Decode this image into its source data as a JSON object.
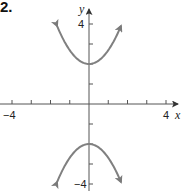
{
  "problem_number": "2.",
  "chart_data": {
    "type": "line",
    "title": "",
    "xlabel": "x",
    "ylabel": "y",
    "xlim": [
      -4.5,
      4.7
    ],
    "ylim": [
      -4.3,
      5.2
    ],
    "x_tick_labels": [
      "-4",
      "4"
    ],
    "y_tick_labels": [
      "4",
      "-4"
    ],
    "x_ticks": [
      -4,
      -3,
      -2,
      -1,
      1,
      2,
      3,
      4
    ],
    "y_ticks": [
      -4,
      -3,
      -2,
      -1,
      1,
      2,
      3,
      4
    ],
    "grid": false,
    "series": [
      {
        "name": "upper branch",
        "color": "#808080",
        "vertex": [
          0,
          2
        ],
        "x": [
          -1.66,
          -1,
          0,
          1,
          1.66
        ],
        "y": [
          3.9,
          2.7,
          2,
          2.7,
          3.9
        ],
        "arrows": true
      },
      {
        "name": "lower branch",
        "color": "#808080",
        "vertex": [
          0,
          -2
        ],
        "x": [
          -1.66,
          -1,
          0,
          1,
          1.66
        ],
        "y": [
          -3.9,
          -2.7,
          -2,
          -2.7,
          -3.9
        ],
        "arrows": true
      }
    ]
  },
  "axis": {
    "x_name": "x",
    "y_name": "y",
    "x_min_label": "−4",
    "x_max_label": "4",
    "y_max_label": "4",
    "y_min_label": "−4"
  }
}
